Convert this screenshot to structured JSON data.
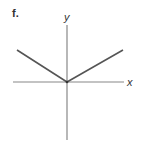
{
  "figure": {
    "label": "f.",
    "x_axis_label": "x",
    "y_axis_label": "y",
    "colors": {
      "axes": "#888888",
      "curve": "#555555"
    }
  },
  "geometry": {
    "origin": [
      67,
      82
    ],
    "x_axis": {
      "x1": 13,
      "x2": 124,
      "y": 82
    },
    "y_axis": {
      "x": 67,
      "y1": 25,
      "y2": 140
    },
    "curve_points": [
      [
        17,
        50
      ],
      [
        67,
        82
      ],
      [
        123,
        50
      ]
    ]
  }
}
